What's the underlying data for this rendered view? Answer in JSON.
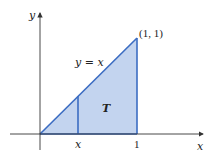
{
  "figure": {
    "type": "region-diagram",
    "axes": {
      "x_label": "x",
      "y_label": "y"
    },
    "curve_label": "y = x",
    "region_label": "T",
    "point_label": "(1, 1)",
    "tick_labels": {
      "x_variable": "x",
      "x_one": "1"
    },
    "colors": {
      "fill": "#c3d4ef",
      "edge": "#3b6cc2",
      "axis": "#333333"
    }
  }
}
